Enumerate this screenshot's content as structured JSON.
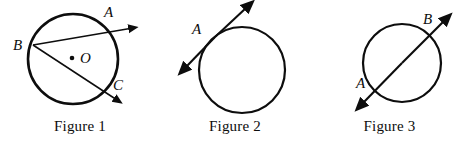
{
  "page": {
    "background_color": "#ffffff",
    "ink_color": "#0d0d0d",
    "width": 469,
    "height": 147
  },
  "figures": [
    {
      "id": "figure-1",
      "caption": "Figure 1",
      "description": "Circle with center O; two rays from point B, one through A and one through C",
      "circle": {
        "cx": 73,
        "cy": 59,
        "r": 45
      },
      "center_point": {
        "label": "O",
        "x": 72,
        "y": 58,
        "label_x": 80,
        "label_y": 62
      },
      "points": [
        {
          "label": "A",
          "x": 108,
          "y": 31,
          "label_x": 106,
          "label_y": 16
        },
        {
          "label": "B",
          "x": 33,
          "y": 45,
          "label_x": 14,
          "label_y": 48
        },
        {
          "label": "C",
          "x": 107,
          "y": 90,
          "label_x": 113,
          "label_y": 88
        }
      ],
      "rays": [
        {
          "name": "ray-BA",
          "from_label": "B",
          "through_label": "A",
          "x1": 33,
          "y1": 45,
          "x2": 133,
          "y2": 28
        },
        {
          "name": "ray-BC",
          "from_label": "B",
          "through_label": "C",
          "x1": 33,
          "y1": 45,
          "x2": 118,
          "y2": 101
        }
      ]
    },
    {
      "id": "figure-2",
      "caption": "Figure 2",
      "description": "Circle with a tangent line touching at point A",
      "circle": {
        "cx": 242,
        "cy": 70,
        "r": 43
      },
      "points": [
        {
          "label": "A",
          "x": 212,
          "y": 40,
          "label_x": 194,
          "label_y": 30
        }
      ],
      "rays": [
        {
          "name": "tangent-line",
          "from_label": "A",
          "x1": 183,
          "y1": 70,
          "x2": 248,
          "y2": 6
        }
      ]
    },
    {
      "id": "figure-3",
      "caption": "Figure 3",
      "description": "Circle with a secant line through points A and B",
      "circle": {
        "cx": 402,
        "cy": 63,
        "r": 39
      },
      "points": [
        {
          "label": "A",
          "x": 376,
          "y": 90,
          "label_x": 358,
          "label_y": 84
        },
        {
          "label": "B",
          "x": 428,
          "y": 37,
          "label_x": 424,
          "label_y": 21
        }
      ],
      "rays": [
        {
          "name": "secant-line",
          "from_label": "A",
          "through_label": "B",
          "x1": 360,
          "y1": 106,
          "x2": 447,
          "y2": 18
        }
      ]
    }
  ]
}
